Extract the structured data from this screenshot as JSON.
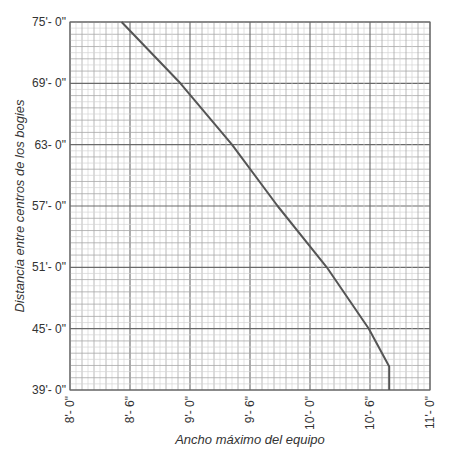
{
  "chart_data": {
    "type": "line",
    "title": "",
    "xlabel": "Ancho máximo del equipo",
    "ylabel": "Distancia entre centros de los bogies",
    "xlim": [
      8.0,
      11.0
    ],
    "ylim": [
      39,
      75
    ],
    "grid": true,
    "legend": "none",
    "x_ticks": [
      8.0,
      8.5,
      9.0,
      9.5,
      10.0,
      10.5,
      11.0
    ],
    "x_tick_labels": [
      "8'- 0\"",
      "8'- 6\"",
      "9'- 0\"",
      "9'- 6\"",
      "10'- 0\"",
      "10'- 6\"",
      "11'- 0\""
    ],
    "y_ticks": [
      39,
      45,
      51,
      57,
      63,
      69,
      75
    ],
    "y_tick_labels": [
      "39'- 0\"",
      "45'- 0\"",
      "51'- 0\"",
      "57'- 0\"",
      "63- 0\"",
      "69'- 0\"",
      "75'- 0\""
    ],
    "series": [
      {
        "name": "Ancho máximo",
        "color": "#555555",
        "x": [
          8.43,
          8.92,
          9.35,
          9.73,
          10.14,
          10.49,
          10.66,
          10.66
        ],
        "y": [
          75,
          69,
          63,
          57,
          51,
          45,
          41.3,
          39
        ]
      }
    ]
  },
  "colors": {
    "major_grid": "#6a6a6a",
    "mid_grid": "#a8a8a8",
    "minor_grid": "#d4d4d4",
    "line": "#555555",
    "text": "#333333"
  }
}
